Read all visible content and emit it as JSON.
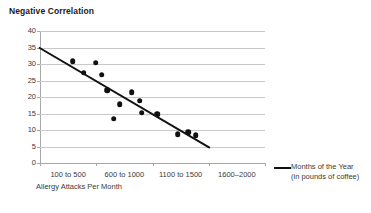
{
  "chart_data": {
    "type": "scatter",
    "title": "Negative Correlation",
    "xlabel": "Allergy Attacks Per Month",
    "ylabel": "",
    "ylim": [
      0,
      40
    ],
    "ytick_step": 5,
    "yticks": [
      "40",
      "35",
      "30",
      "25",
      "20",
      "15",
      "10",
      "5",
      "0"
    ],
    "categories": [
      "100 to 500",
      "600 to 1000",
      "1100 to 1500",
      "1600–2000"
    ],
    "grid": "horizontal",
    "legend_position": "right",
    "legend": [
      {
        "name": "Months of the Year",
        "sub": "(in pounds of coffee)",
        "color": "#111111",
        "marker": "line"
      }
    ],
    "points": [
      {
        "x": 1.08,
        "y": 30.8
      },
      {
        "x": 1.49,
        "y": 30.4
      },
      {
        "x": 1.28,
        "y": 27.4
      },
      {
        "x": 1.6,
        "y": 26.7
      },
      {
        "x": 1.69,
        "y": 22.1
      },
      {
        "x": 2.13,
        "y": 21.4
      },
      {
        "x": 2.27,
        "y": 18.9
      },
      {
        "x": 1.92,
        "y": 17.9
      },
      {
        "x": 2.31,
        "y": 15.2
      },
      {
        "x": 2.58,
        "y": 14.7
      },
      {
        "x": 1.81,
        "y": 13.4
      },
      {
        "x": 2.95,
        "y": 8.8
      },
      {
        "x": 3.13,
        "y": 9.3
      },
      {
        "x": 3.27,
        "y": 8.5
      }
    ],
    "trendline": {
      "x0": 0.48,
      "y0": 35.0,
      "x1": 3.52,
      "y1": 4.6
    }
  }
}
